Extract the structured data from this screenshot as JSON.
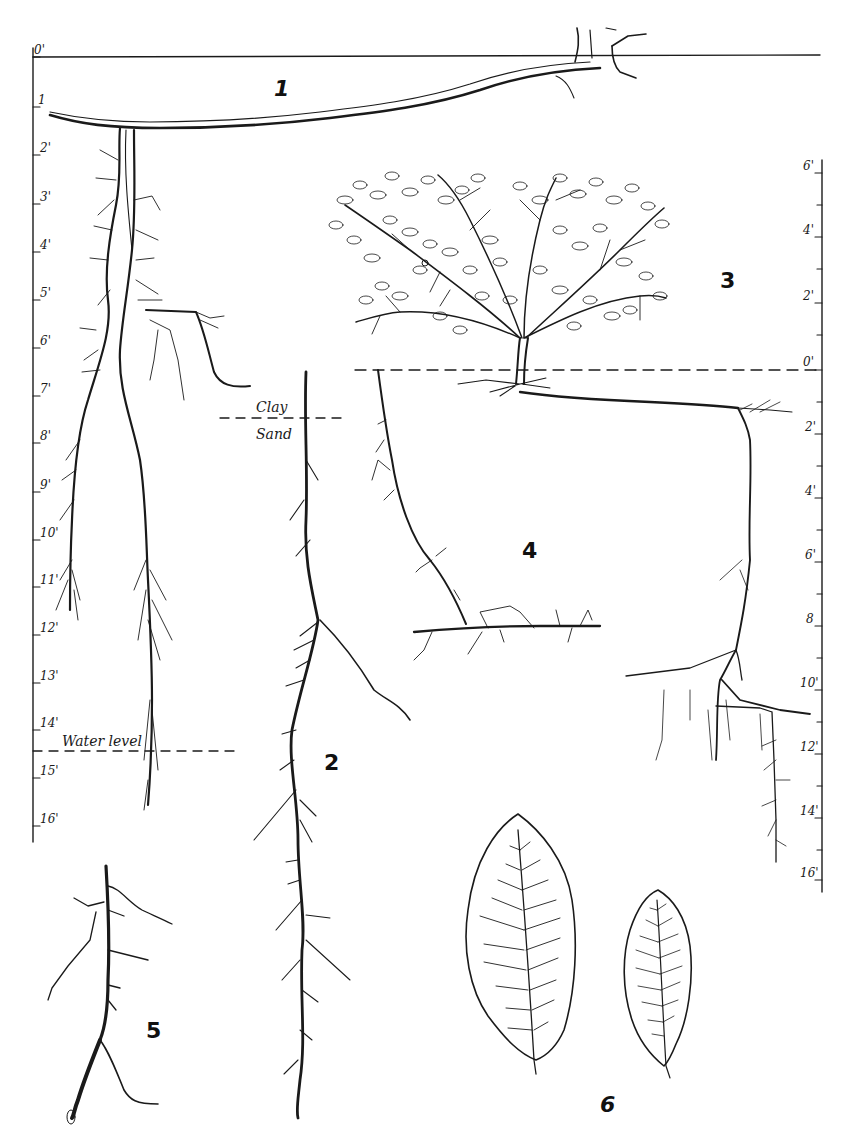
{
  "figure": {
    "panels": [
      {
        "id": "1",
        "label": "1",
        "description": "root system with lateral root and deep vertical roots to water level"
      },
      {
        "id": "2",
        "label": "2",
        "description": "single taproot with short rootlets"
      },
      {
        "id": "3",
        "label": "3",
        "description": "shrub above ground with root system"
      },
      {
        "id": "4",
        "label": "4",
        "description": "oblique root with horizontal branch"
      },
      {
        "id": "5",
        "label": "5",
        "description": "root tip detail"
      },
      {
        "id": "6",
        "label": "6",
        "description": "two leaves"
      }
    ],
    "annotations": {
      "clay": "Clay",
      "sand": "Sand",
      "water_level": "Water level"
    },
    "left_scale": {
      "ticks": [
        "0'",
        "1",
        "2'",
        "3'",
        "4'",
        "5'",
        "6'",
        "7'",
        "8'",
        "9'",
        "10'",
        "11'",
        "12'",
        "13'",
        "14'",
        "15'",
        "16'"
      ]
    },
    "right_scale_above": {
      "ticks": [
        "6'",
        "4'",
        "2'",
        "0'"
      ]
    },
    "right_scale_below": {
      "ticks": [
        "2'",
        "4'",
        "6'",
        "8",
        "10'",
        "12'",
        "14'",
        "16'"
      ]
    }
  },
  "colors": {
    "ink": "#1a1a1a",
    "background": "#ffffff"
  }
}
